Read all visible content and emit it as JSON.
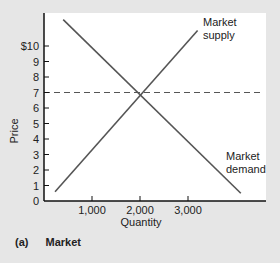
{
  "chart_data": {
    "type": "line",
    "title": "",
    "xlabel": "Quantity",
    "ylabel": "Price",
    "xlim": [
      0,
      4500
    ],
    "ylim": [
      0,
      11.5
    ],
    "x_ticks": [
      1000,
      2000,
      3000
    ],
    "x_tick_labels": [
      "1,000",
      "2,000",
      "3,000"
    ],
    "y_ticks": [
      0,
      1,
      2,
      3,
      4,
      5,
      6,
      7,
      8,
      9,
      10
    ],
    "y_tick_labels": [
      "0",
      "1",
      "2",
      "3",
      "4",
      "5",
      "6",
      "7",
      "8",
      "9",
      "$10"
    ],
    "grid": false,
    "series": [
      {
        "name": "Market supply",
        "label_lines": [
          "Market",
          "supply"
        ],
        "points": [
          [
            230,
            0.6
          ],
          [
            3200,
            11.0
          ]
        ]
      },
      {
        "name": "Market demand",
        "label_lines": [
          "Market",
          "demand"
        ],
        "points": [
          [
            400,
            11.7
          ],
          [
            4100,
            0.5
          ]
        ]
      }
    ],
    "annotations": [
      {
        "type": "hline",
        "y": 7,
        "style": "dashed",
        "description": "Equilibrium price"
      }
    ],
    "equilibrium": {
      "quantity": 2000,
      "price": 7
    }
  },
  "caption": {
    "tag": "(a)",
    "text": "Market"
  },
  "colors": {
    "background": "#e6e6e6",
    "plot_area": "#ffffff",
    "line": "#555555",
    "axis": "#111111"
  }
}
